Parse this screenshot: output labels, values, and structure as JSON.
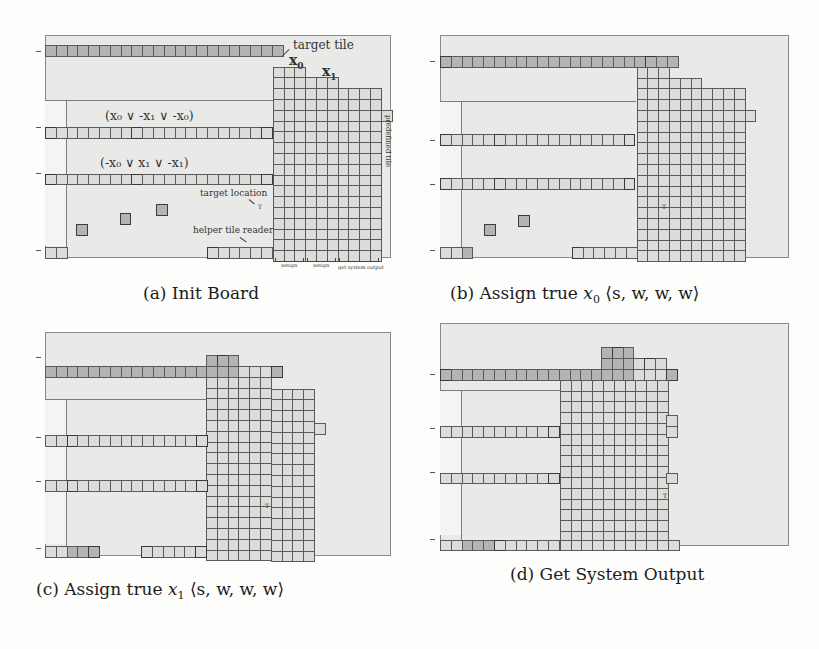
{
  "figure": {
    "panels": [
      {
        "id": "a",
        "caption": "(a) Init Board",
        "frame": {
          "x": 45,
          "y": 35,
          "w": 346,
          "h": 223
        },
        "unit": 10.8,
        "origin": {
          "x": 45,
          "y": 45
        },
        "ticks_y": [
          0,
          7,
          11.5,
          18.5
        ],
        "divider": {
          "y": 7.5,
          "x_from": 0,
          "x_to": 21.1,
          "vx": 2
        }
      },
      {
        "id": "b",
        "caption": "(b) Assign true x0 ⟨s, w, w, w⟩",
        "frame": {
          "x": 440,
          "y": 35,
          "w": 349,
          "h": 223
        },
        "unit": 10.8,
        "origin": {
          "x": 440,
          "y": 57
        },
        "ticks_y": [
          0,
          7,
          11.2,
          17.7
        ],
        "divider": {
          "y": 4.2,
          "x_from": 0,
          "x_to": 18.2,
          "vx": 2
        }
      },
      {
        "id": "c",
        "caption": "(c) Assign true x1 ⟨s, w, w, w⟩",
        "frame": {
          "x": 45,
          "y": 332,
          "w": 346,
          "h": 224
        },
        "unit": 10.8,
        "origin": {
          "x": 45,
          "y": 365
        },
        "ticks_y": [
          0,
          6.5,
          10.7,
          17.2
        ],
        "divider": {
          "y": 3.1,
          "x_from": 0,
          "x_to": 14.9,
          "vx": 2
        }
      },
      {
        "id": "d",
        "caption": "(d) Get System Output",
        "frame": {
          "x": 440,
          "y": 323,
          "w": 349,
          "h": 223
        },
        "unit": 10.8,
        "origin": {
          "x": 440,
          "y": 369
        },
        "ticks_y": [
          0,
          5.3,
          9.6,
          15.9
        ],
        "divider": {
          "y": 2.4,
          "x_from": 0,
          "x_to": 11.1,
          "vx": 2
        }
      }
    ],
    "captions": {
      "a": {
        "prefix": "(a) ",
        "text": "Init Board"
      },
      "b": {
        "prefix": "(b) ",
        "text": "Assign true ",
        "var": "x",
        "sub": "0",
        "tuple": "⟨s, w, w, w⟩"
      },
      "c": {
        "prefix": "(c) ",
        "text": "Assign true ",
        "var": "x",
        "sub": "1",
        "tuple": "⟨s, w, w, w⟩"
      },
      "d": {
        "prefix": "(d) ",
        "text": "Get System Output"
      }
    },
    "annotations": {
      "target_tile": "target tile",
      "x0": "x",
      "x0_sub": "0",
      "x1": "x",
      "x1_sub": "1",
      "clause1": "(x₀  ∨  -x₁  ∨  -x₀)",
      "clause2": "(-x₀  ∨  x₁  ∨  -x₁)",
      "target_location": "target location",
      "helper_tile_reader": "helper tile reader",
      "predefined_tile": "predefined tile",
      "assign_1": "assign",
      "assign_2": "assign",
      "get_system_output": "get system output",
      "target_marker": "T"
    },
    "tile_rows": {
      "a": [
        {
          "r": 0,
          "c": 0,
          "n": 22,
          "shade": [
            0,
            1,
            2,
            3,
            4,
            5,
            6,
            7,
            8,
            9,
            10,
            11,
            12,
            13,
            14,
            15,
            16,
            17,
            18,
            19,
            20,
            21
          ]
        },
        {
          "r": 2,
          "c": 21.1,
          "n": 3,
          "shade": []
        },
        {
          "r": 3,
          "c": 21.1,
          "n": 6,
          "shade": []
        },
        {
          "r": 4,
          "c": 21.1,
          "n": 10,
          "shade": []
        },
        {
          "r": 5,
          "c": 21.1,
          "n": 11,
          "shade": []
        },
        {
          "r": 6,
          "c": 21.1,
          "n": 10,
          "shade": []
        },
        {
          "r": 7,
          "c": 0,
          "n": 21,
          "dark": [
            0,
            8,
            20
          ],
          "shade": []
        },
        {
          "r": 7,
          "c": 21.1,
          "n": 10,
          "shade": []
        },
        {
          "r": 8,
          "c": 21.1,
          "n": 10,
          "shade": []
        },
        {
          "r": 9,
          "c": 21.1,
          "n": 10,
          "shade": []
        },
        {
          "r": 10,
          "c": 21.1,
          "n": 10,
          "shade": []
        },
        {
          "r": 11,
          "c": 0,
          "n": 21,
          "dark": [
            0,
            8,
            20
          ],
          "shade": []
        },
        {
          "r": 11,
          "c": 21.1,
          "n": 10,
          "shade": []
        },
        {
          "r": 12,
          "c": 21.1,
          "n": 10,
          "shade": []
        },
        {
          "r": 13,
          "c": 21.1,
          "n": 10,
          "shade": []
        },
        {
          "r": 14,
          "c": 21.1,
          "n": 10,
          "shade": []
        },
        {
          "r": 15,
          "c": 21.1,
          "n": 10,
          "shade": []
        },
        {
          "r": 16,
          "c": 21.1,
          "n": 10,
          "shade": []
        },
        {
          "r": 17,
          "c": 21.1,
          "n": 10,
          "shade": []
        },
        {
          "r": 18,
          "c": 0,
          "n": 2,
          "shade": []
        },
        {
          "r": 18,
          "c": 15,
          "n": 6,
          "dark": [
            0
          ],
          "shade": []
        },
        {
          "r": 18,
          "c": 21.1,
          "n": 10,
          "shade": []
        }
      ],
      "a_top_stairs": [
        {
          "r": 1.9,
          "c": 21.1,
          "n": 3
        },
        {
          "r": 2.9,
          "c": 24.1,
          "n": 3
        },
        {
          "r": 3.9,
          "c": 27.1,
          "n": 4
        }
      ],
      "a_extra": [
        {
          "r": 5,
          "c": 31.1,
          "n": 1
        }
      ],
      "a_helpers": [
        {
          "x": 2.9,
          "y": 16.2
        },
        {
          "x": 6.9,
          "y": 15.3
        },
        {
          "x": 10.3,
          "y": 14.4
        }
      ]
    }
  }
}
